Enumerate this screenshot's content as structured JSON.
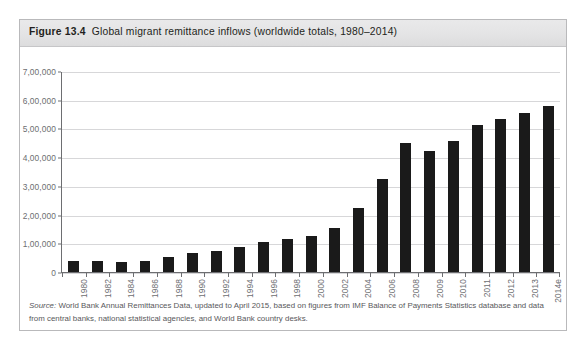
{
  "figure": {
    "label": "Figure 13.4",
    "caption": "Global migrant remittance inflows (worldwide totals, 1980–2014)",
    "source_label": "Source:",
    "source_text": " World Bank Annual Remittances Data, updated to April 2015, based on figures from IMF Balance of Payments Statistics database and data from central banks, national statistical agencies, and World Bank country desks."
  },
  "colors": {
    "bar": "#1a1a1a",
    "axis": "#6d6e71",
    "gridline": "#d7d7d9",
    "header_background": "#e4e4e5",
    "border": "#b9b9bb",
    "text": "#231f20",
    "source_text": "#58585b"
  },
  "chart_data": {
    "type": "bar",
    "title": "Global migrant remittance inflows (worldwide totals, 1980–2014)",
    "xlabel": "",
    "ylabel": "",
    "ylim": [
      0,
      700000
    ],
    "yticks": [
      0,
      100000,
      200000,
      300000,
      400000,
      500000,
      600000,
      700000
    ],
    "ytick_labels": [
      "0",
      "1,00,000",
      "2,00,000",
      "3,00,000",
      "4,00,000",
      "5,00,000",
      "6,00,000",
      "7,00,000"
    ],
    "grid": true,
    "legend": "none",
    "unit_note": "US$ millions",
    "categories": [
      "1980",
      "1982",
      "1984",
      "1986",
      "1988",
      "1990",
      "1992",
      "1994",
      "1996",
      "1998",
      "2000",
      "2002",
      "2004",
      "2006",
      "2008",
      "2009",
      "2010",
      "2011",
      "2012",
      "2013",
      "2014e"
    ],
    "values": [
      37000,
      37000,
      36000,
      40000,
      52000,
      66000,
      74000,
      88000,
      105000,
      115000,
      127000,
      155000,
      225000,
      325000,
      450000,
      422000,
      460000,
      515000,
      535000,
      555000,
      582000
    ]
  }
}
